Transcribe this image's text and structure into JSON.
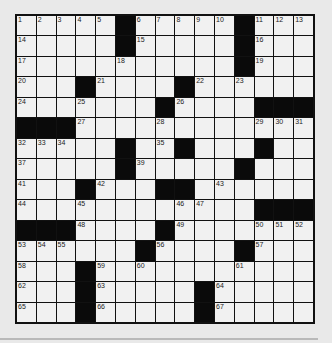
{
  "puzzle": {
    "rows": 15,
    "cols": 15,
    "colors": {
      "background": "#e9e9e9",
      "cell": "#f1f1f1",
      "block": "#0a0a0a",
      "border": "#111111"
    },
    "grid": [
      "....._....._...",
      "....._....._...",
      "..........._...",
      "..._...._......",
      "......._....___",
      "___............",
      "....._.._..._..",
      "....._.....#...",
      "..._...__......",
      "............___",
      "___...._.......",
      "......_...._...",
      "..._...........",
      "..._....._.....",
      "..._....._....."
    ],
    "numbers": [
      {
        "r": 0,
        "c": 0,
        "n": "1"
      },
      {
        "r": 0,
        "c": 1,
        "n": "2"
      },
      {
        "r": 0,
        "c": 2,
        "n": "3"
      },
      {
        "r": 0,
        "c": 3,
        "n": "4"
      },
      {
        "r": 0,
        "c": 4,
        "n": "5"
      },
      {
        "r": 0,
        "c": 6,
        "n": "6"
      },
      {
        "r": 0,
        "c": 7,
        "n": "7"
      },
      {
        "r": 0,
        "c": 8,
        "n": "8"
      },
      {
        "r": 0,
        "c": 9,
        "n": "9"
      },
      {
        "r": 0,
        "c": 10,
        "n": "10"
      },
      {
        "r": 0,
        "c": 12,
        "n": "11"
      },
      {
        "r": 0,
        "c": 13,
        "n": "12"
      },
      {
        "r": 0,
        "c": 14,
        "n": "13"
      },
      {
        "r": 1,
        "c": 0,
        "n": "14"
      },
      {
        "r": 1,
        "c": 6,
        "n": "15"
      },
      {
        "r": 1,
        "c": 12,
        "n": "16"
      },
      {
        "r": 2,
        "c": 0,
        "n": "17"
      },
      {
        "r": 2,
        "c": 5,
        "n": "18"
      },
      {
        "r": 2,
        "c": 12,
        "n": "19"
      },
      {
        "r": 3,
        "c": 0,
        "n": "20"
      },
      {
        "r": 3,
        "c": 4,
        "n": "21"
      },
      {
        "r": 3,
        "c": 9,
        "n": "22"
      },
      {
        "r": 3,
        "c": 11,
        "n": "23"
      },
      {
        "r": 4,
        "c": 0,
        "n": "24"
      },
      {
        "r": 4,
        "c": 3,
        "n": "25"
      },
      {
        "r": 4,
        "c": 8,
        "n": "26"
      },
      {
        "r": 5,
        "c": 3,
        "n": "27"
      },
      {
        "r": 5,
        "c": 7,
        "n": "28"
      },
      {
        "r": 5,
        "c": 12,
        "n": "29"
      },
      {
        "r": 5,
        "c": 13,
        "n": "30"
      },
      {
        "r": 5,
        "c": 14,
        "n": "31"
      },
      {
        "r": 6,
        "c": 0,
        "n": "32"
      },
      {
        "r": 6,
        "c": 1,
        "n": "33"
      },
      {
        "r": 6,
        "c": 2,
        "n": "34"
      },
      {
        "r": 6,
        "c": 7,
        "n": "35"
      },
      {
        "r": 6,
        "c": 12,
        "n": "36"
      },
      {
        "r": 7,
        "c": 0,
        "n": "37"
      },
      {
        "r": 7,
        "c": 5,
        "n": "38"
      },
      {
        "r": 7,
        "c": 6,
        "n": "39"
      },
      {
        "r": 7,
        "c": 11,
        "n": "40"
      },
      {
        "r": 8,
        "c": 0,
        "n": "41"
      },
      {
        "r": 8,
        "c": 4,
        "n": "42"
      },
      {
        "r": 8,
        "c": 10,
        "n": "43"
      },
      {
        "r": 9,
        "c": 0,
        "n": "44"
      },
      {
        "r": 9,
        "c": 3,
        "n": "45"
      },
      {
        "r": 9,
        "c": 8,
        "n": "46"
      },
      {
        "r": 9,
        "c": 9,
        "n": "47"
      },
      {
        "r": 10,
        "c": 3,
        "n": "48"
      },
      {
        "r": 10,
        "c": 8,
        "n": "49"
      },
      {
        "r": 10,
        "c": 12,
        "n": "50"
      },
      {
        "r": 10,
        "c": 13,
        "n": "51"
      },
      {
        "r": 10,
        "c": 14,
        "n": "52"
      },
      {
        "r": 11,
        "c": 0,
        "n": "53"
      },
      {
        "r": 11,
        "c": 1,
        "n": "54"
      },
      {
        "r": 11,
        "c": 2,
        "n": "55"
      },
      {
        "r": 11,
        "c": 7,
        "n": "56"
      },
      {
        "r": 11,
        "c": 12,
        "n": "57"
      },
      {
        "r": 12,
        "c": 0,
        "n": "58"
      },
      {
        "r": 12,
        "c": 4,
        "n": "59"
      },
      {
        "r": 12,
        "c": 6,
        "n": "60"
      },
      {
        "r": 12,
        "c": 11,
        "n": "61"
      },
      {
        "r": 13,
        "c": 0,
        "n": "62"
      },
      {
        "r": 13,
        "c": 4,
        "n": "63"
      },
      {
        "r": 13,
        "c": 10,
        "n": "64"
      },
      {
        "r": 14,
        "c": 0,
        "n": "65"
      },
      {
        "r": 14,
        "c": 4,
        "n": "66"
      },
      {
        "r": 14,
        "c": 10,
        "n": "67"
      }
    ]
  }
}
